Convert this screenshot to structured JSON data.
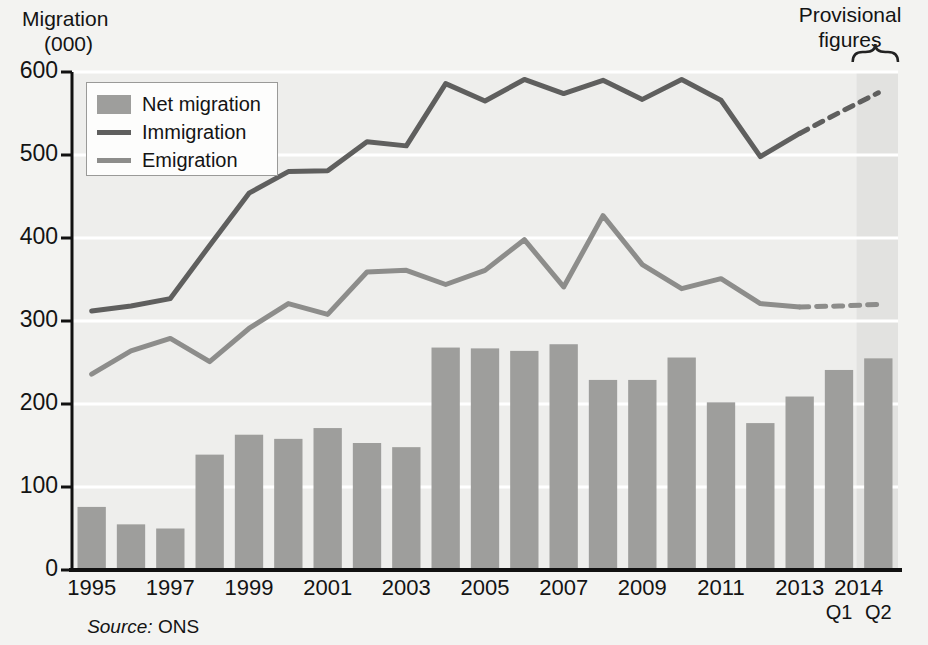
{
  "title_lines": {
    "line1": "Migration",
    "line2": "(000)"
  },
  "source_note": {
    "prefix": "Source:",
    "value": " ONS"
  },
  "provisional": {
    "caption": "Provisional\nfigures",
    "band_start_year_index": 20
  },
  "legend": {
    "items": [
      {
        "label": "Net migration",
        "marker": "bar",
        "color": "#9e9e9c"
      },
      {
        "label": "Immigration",
        "marker": "line",
        "color": "#5f5f5e"
      },
      {
        "label": "Emigration",
        "marker": "line",
        "color": "#8d8d8b"
      }
    ]
  },
  "chart_data": {
    "type": "bar",
    "title": "Migration (000)",
    "xlabel": "",
    "ylabel": "Migration (000)",
    "ylim": [
      0,
      600
    ],
    "yticks": [
      0,
      100,
      200,
      300,
      400,
      500,
      600
    ],
    "grid": true,
    "legend_position": "top-left",
    "categories": [
      "1995",
      "1996",
      "1997",
      "1998",
      "1999",
      "2000",
      "2001",
      "2002",
      "2003",
      "2004",
      "2005",
      "2006",
      "2007",
      "2008",
      "2009",
      "2010",
      "2011",
      "2012",
      "2013",
      "2014 Q1",
      "2014 Q2"
    ],
    "xtick_labels": [
      "1995",
      "1997",
      "1999",
      "2001",
      "2003",
      "2005",
      "2007",
      "2009",
      "2011",
      "2013",
      "2014"
    ],
    "xtick_label_indices": [
      0,
      2,
      4,
      6,
      8,
      10,
      12,
      14,
      16,
      18,
      19.5
    ],
    "quarter_labels": [
      "Q1",
      "Q2"
    ],
    "series": [
      {
        "name": "Net migration",
        "type": "bar",
        "color": "#9e9e9c",
        "values": [
          76,
          55,
          50,
          139,
          163,
          158,
          171,
          153,
          148,
          268,
          267,
          264,
          272,
          229,
          229,
          256,
          202,
          177,
          209,
          241,
          255
        ]
      },
      {
        "name": "Immigration",
        "type": "line",
        "color": "#5f5f5e",
        "values": [
          312,
          318,
          327,
          391,
          454,
          480,
          481,
          516,
          511,
          586,
          565,
          591,
          574,
          590,
          567,
          591,
          566,
          498,
          526,
          551,
          575
        ],
        "provisional_from_index": 18
      },
      {
        "name": "Emigration",
        "type": "line",
        "color": "#8d8d8b",
        "values": [
          236,
          264,
          279,
          251,
          291,
          321,
          308,
          359,
          361,
          344,
          361,
          398,
          341,
          427,
          368,
          339,
          351,
          321,
          317,
          318,
          320
        ],
        "provisional_from_index": 18
      }
    ]
  }
}
